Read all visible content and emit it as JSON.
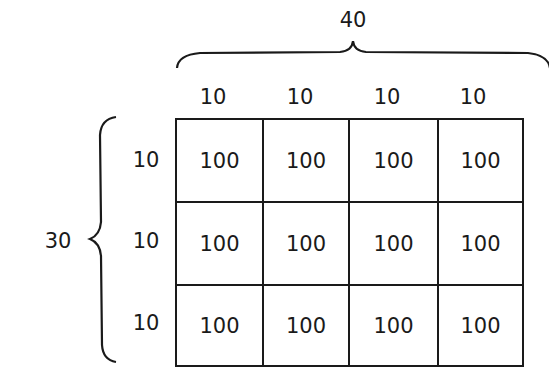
{
  "diagram": {
    "type": "area-model-grid",
    "total_width_label": "40",
    "total_height_label": "30",
    "column_labels": [
      "10",
      "10",
      "10",
      "10"
    ],
    "row_labels": [
      "10",
      "10",
      "10"
    ],
    "cells": [
      [
        "100",
        "100",
        "100",
        "100"
      ],
      [
        "100",
        "100",
        "100",
        "100"
      ],
      [
        "100",
        "100",
        "100",
        "100"
      ]
    ],
    "line_color": "#1a1a1a"
  }
}
